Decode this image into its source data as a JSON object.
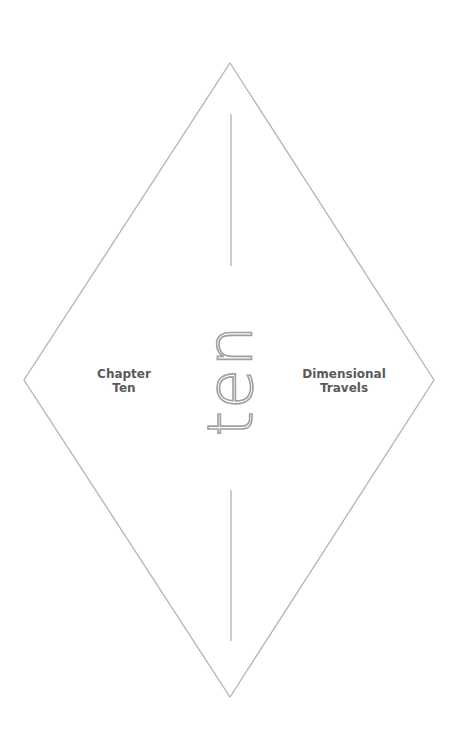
{
  "chapter": {
    "left_label": [
      "Chapter",
      "Ten"
    ],
    "right_label": [
      "Dimensional",
      "Travels"
    ],
    "center_word": "ten"
  },
  "colors": {
    "line": "#b4b4b4",
    "label_text": "#5a5a5a",
    "center_word": "#a0a0a0",
    "background": "#ffffff"
  }
}
